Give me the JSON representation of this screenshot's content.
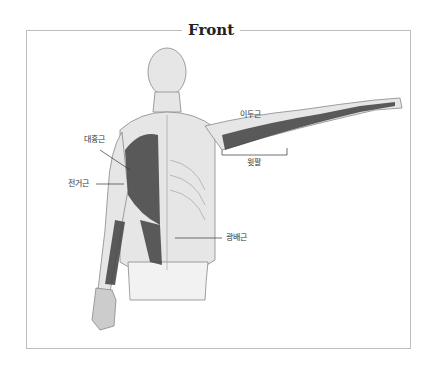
{
  "title": "Front",
  "labels": {
    "pectoralis": "대흉근",
    "serratus": "전거근",
    "biceps": "이두근",
    "upper_arm": "윗팔",
    "latissimus": "광배근"
  },
  "colors": {
    "frame": "#bdbdbd",
    "muscle": "#4a4a4a",
    "skin": "#e6e6e6",
    "outline": "#888888"
  }
}
